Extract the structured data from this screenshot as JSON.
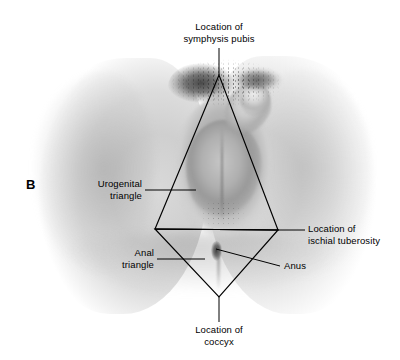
{
  "figure": {
    "panel_letter": "B",
    "background_color": "#ffffff",
    "line_color": "#000000",
    "text_color": "#000000"
  },
  "labels": {
    "symphysis_pubis": "Location of\nsymphysis pubis",
    "urogenital_triangle": "Urogenital\ntriangle",
    "ischial_tuberosity": "Location of\nischial tuberosity",
    "anal_triangle": "Anal\ntriangle",
    "anus": "Anus",
    "coccyx": "Location of\ncoccyx"
  },
  "diagram": {
    "vertices": {
      "symphysis_pubis": [
        219,
        75
      ],
      "ischial_tuberosity_left": [
        155,
        229
      ],
      "ischial_tuberosity_right": [
        278,
        230
      ],
      "coccyx": [
        219,
        297
      ]
    },
    "shapes": [
      {
        "name": "urogenital-triangle",
        "points": "219,75 155,229 278,230"
      },
      {
        "name": "anal-triangle",
        "points": "155,229 278,230 219,297"
      },
      {
        "name": "interischial-line",
        "points": "155,229 278,230"
      }
    ],
    "leaders": [
      {
        "name": "symphysis-pubis-leader",
        "from": [
          219,
          48
        ],
        "to": [
          219,
          75
        ]
      },
      {
        "name": "urogenital-triangle-leader",
        "from": [
          145,
          190
        ],
        "to": [
          196,
          190
        ]
      },
      {
        "name": "ischial-tuberosity-leader",
        "from": [
          278,
          230
        ],
        "to": [
          305,
          230
        ]
      },
      {
        "name": "anal-triangle-leader",
        "from": [
          157,
          259
        ],
        "to": [
          205,
          259
        ]
      },
      {
        "name": "anus-leader",
        "from": [
          216,
          249
        ],
        "to": [
          280,
          266
        ]
      },
      {
        "name": "coccyx-leader",
        "from": [
          219,
          297
        ],
        "to": [
          219,
          322
        ]
      }
    ]
  }
}
